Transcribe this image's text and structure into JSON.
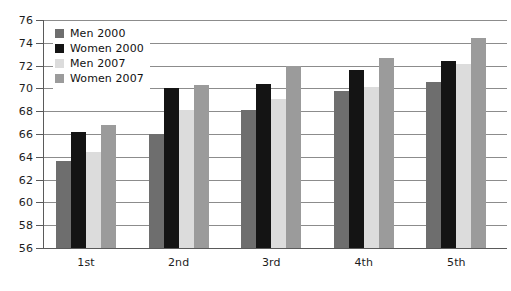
{
  "chart_data": {
    "type": "bar",
    "title": "",
    "xlabel": "",
    "ylabel": "",
    "categories": [
      "1st",
      "2nd",
      "3rd",
      "4th",
      "5th"
    ],
    "ylim": [
      56,
      76
    ],
    "ytick_step": 2,
    "yticks": [
      56,
      58,
      60,
      62,
      64,
      66,
      68,
      70,
      72,
      74,
      76
    ],
    "grid": true,
    "legend_position": "top-left",
    "series": [
      {
        "name": "Men 2000",
        "color": "#6e6e6e",
        "values": [
          63.6,
          66.0,
          68.1,
          69.8,
          70.6
        ]
      },
      {
        "name": "Women 2000",
        "color": "#141414",
        "values": [
          66.2,
          70.0,
          70.4,
          71.6,
          72.4
        ]
      },
      {
        "name": "Men 2007",
        "color": "#dcdcdc",
        "values": [
          64.4,
          68.1,
          69.1,
          70.1,
          72.1
        ]
      },
      {
        "name": "Women 2007",
        "color": "#9b9b9b",
        "values": [
          66.8,
          70.3,
          72.0,
          72.7,
          74.4
        ]
      }
    ]
  }
}
